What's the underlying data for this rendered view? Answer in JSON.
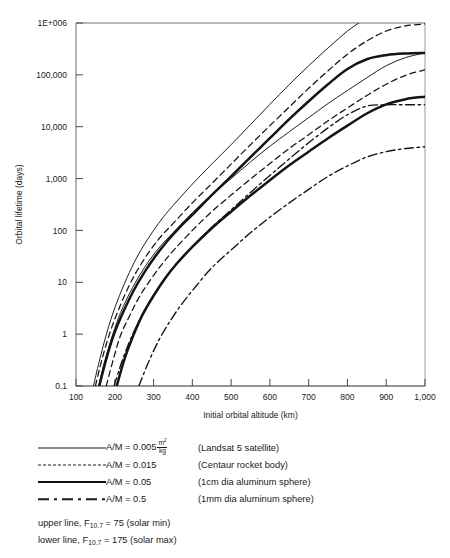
{
  "figure": {
    "plot_area": {
      "left": 76,
      "top": 23,
      "right": 425,
      "bottom": 386
    }
  },
  "chart_data": {
    "type": "line",
    "title": "",
    "xlabel": "Initial orbital altitude (km)",
    "ylabel": "Orbital lifetime (days)",
    "xscale": "linear",
    "yscale": "log",
    "xlim": [
      100,
      1000
    ],
    "ylim": [
      0.1,
      1000000
    ],
    "xticks": [
      100,
      200,
      300,
      400,
      500,
      600,
      700,
      800,
      900,
      1000
    ],
    "xticklabels": [
      "100",
      "200",
      "300",
      "400",
      "500",
      "600",
      "700",
      "800",
      "900",
      "1,000"
    ],
    "yticks": [
      0.1,
      1,
      10,
      100,
      1000,
      10000,
      100000,
      1000000
    ],
    "yticklabels": [
      "0.1",
      "1",
      "10",
      "100",
      "1,000",
      "10,000",
      "100,000",
      "1E+006"
    ],
    "grid": false,
    "legend_position": "below-axes",
    "series": [
      {
        "name": "A/M = 0.005 m2/kg (Landsat 5 satellite), F10.7 = 75 (solar min)",
        "am": 0.005,
        "style": "solid-thin",
        "solar": "min",
        "x": [
          145,
          160,
          180,
          200,
          225,
          250,
          275,
          300,
          325,
          350,
          400,
          450,
          500,
          550,
          600,
          650,
          700,
          750,
          800,
          830
        ],
        "y": [
          0.1,
          0.3,
          1.1,
          3.2,
          9.5,
          24,
          52,
          100,
          180,
          300,
          780,
          1900,
          4500,
          11000,
          27000,
          65000,
          150000,
          330000,
          700000,
          1000000
        ]
      },
      {
        "name": "A/M = 0.005 m2/kg (Landsat 5 satellite), F10.7 = 175 (solar max)",
        "am": 0.005,
        "style": "solid-thin",
        "solar": "max",
        "x": [
          158,
          175,
          195,
          215,
          240,
          265,
          290,
          320,
          350,
          400,
          450,
          500,
          550,
          600,
          650,
          700,
          750,
          800,
          850,
          900,
          950,
          1000
        ],
        "y": [
          0.1,
          0.32,
          1.0,
          2.6,
          6.5,
          14,
          27,
          52,
          90,
          220,
          490,
          1000,
          2100,
          4200,
          8000,
          15000,
          28000,
          50000,
          88000,
          150000,
          215000,
          265000
        ]
      },
      {
        "name": "A/M = 0.015 (Centaur rocket body), F10.7 = 75 (solar min)",
        "am": 0.015,
        "style": "dashed",
        "solar": "min",
        "x": [
          150,
          168,
          188,
          210,
          235,
          260,
          290,
          320,
          350,
          400,
          450,
          500,
          550,
          600,
          650,
          700,
          750,
          800,
          850,
          900,
          950,
          1000
        ],
        "y": [
          0.1,
          0.35,
          1.1,
          3.0,
          8.0,
          18,
          40,
          78,
          135,
          340,
          800,
          1900,
          4500,
          10500,
          24000,
          55000,
          120000,
          250000,
          450000,
          700000,
          880000,
          960000
        ]
      },
      {
        "name": "A/M = 0.015 (Centaur rocket body), F10.7 = 175 (solar max)",
        "am": 0.015,
        "style": "dashed",
        "solar": "max",
        "x": [
          178,
          196,
          215,
          240,
          265,
          295,
          325,
          355,
          400,
          450,
          500,
          550,
          600,
          650,
          700,
          750,
          800,
          850,
          900,
          950,
          1000
        ],
        "y": [
          0.1,
          0.32,
          0.95,
          2.4,
          5.5,
          12,
          24,
          44,
          100,
          230,
          480,
          980,
          1950,
          3800,
          7000,
          13000,
          23000,
          40000,
          66000,
          98000,
          125000
        ]
      },
      {
        "name": "A/M = 0.05 (1cm dia aluminum sphere), F10.7 = 75 (solar min)",
        "am": 0.05,
        "style": "solid-thick",
        "solar": "min",
        "x": [
          160,
          178,
          198,
          222,
          248,
          275,
          305,
          335,
          365,
          400,
          450,
          500,
          550,
          600,
          650,
          700,
          750,
          800,
          850,
          900,
          950,
          1000
        ],
        "y": [
          0.1,
          0.33,
          1.0,
          2.7,
          6.8,
          15,
          32,
          62,
          110,
          200,
          480,
          1100,
          2600,
          6000,
          14000,
          31000,
          66000,
          130000,
          200000,
          240000,
          258000,
          265000
        ]
      },
      {
        "name": "A/M = 0.05 (1cm dia aluminum sphere), F10.7 = 175 (solar max)",
        "am": 0.05,
        "style": "solid-thick",
        "solar": "max",
        "x": [
          205,
          225,
          248,
          272,
          300,
          330,
          360,
          400,
          450,
          500,
          550,
          600,
          650,
          700,
          750,
          800,
          850,
          900,
          950,
          1000
        ],
        "y": [
          0.1,
          0.33,
          0.95,
          2.4,
          5.5,
          12,
          23,
          48,
          110,
          230,
          470,
          930,
          1800,
          3300,
          6000,
          10500,
          18000,
          27000,
          34000,
          38000
        ]
      },
      {
        "name": "A/M = 0.5 (1mm dia aluminum sphere), F10.7 = 75 (solar min)",
        "am": 0.5,
        "style": "dashdot",
        "solar": "min",
        "x": [
          198,
          220,
          245,
          272,
          300,
          330,
          360,
          400,
          450,
          500,
          550,
          600,
          650,
          700,
          750,
          800,
          850,
          900,
          950,
          1000
        ],
        "y": [
          0.1,
          0.32,
          0.95,
          2.4,
          5.5,
          12,
          23,
          48,
          115,
          250,
          540,
          1150,
          2400,
          4900,
          9500,
          17000,
          25000,
          26500,
          26500,
          26500
        ]
      },
      {
        "name": "A/M = 0.5 (1mm dia aluminum sphere), F10.7 = 175 (solar max)",
        "am": 0.5,
        "style": "dashdot",
        "solar": "max",
        "x": [
          262,
          288,
          315,
          345,
          375,
          410,
          450,
          500,
          550,
          600,
          650,
          700,
          750,
          800,
          850,
          900,
          950,
          1000
        ],
        "y": [
          0.1,
          0.3,
          0.8,
          1.9,
          4.0,
          8.5,
          19,
          42,
          90,
          180,
          340,
          620,
          1100,
          1750,
          2600,
          3300,
          3800,
          4100
        ]
      }
    ]
  },
  "legend": {
    "rows": [
      {
        "style": "solid-thin",
        "am_label": "A/M = 0.005",
        "unit_num": "m",
        "unit_sup": "2",
        "unit_den": "kg",
        "desc": "(Landsat 5 satellite)"
      },
      {
        "style": "dashed",
        "am_label": "A/M = 0.015",
        "unit_num": "",
        "unit_sup": "",
        "unit_den": "",
        "desc": "(Centaur rocket body)"
      },
      {
        "style": "solid-thick",
        "am_label": "A/M = 0.05",
        "unit_num": "",
        "unit_sup": "",
        "unit_den": "",
        "desc": "(1cm dia aluminum sphere)"
      },
      {
        "style": "dashdot",
        "am_label": "A/M = 0.5",
        "unit_num": "",
        "unit_sup": "",
        "unit_den": "",
        "desc": "(1mm dia aluminum sphere)"
      }
    ],
    "notes": [
      {
        "prefix": "upper line, F",
        "sub": "10.7",
        "suffix": " = 75 (solar min)"
      },
      {
        "prefix": "lower line, F",
        "sub": "10.7",
        "suffix": " = 175 (solar max)"
      }
    ]
  }
}
